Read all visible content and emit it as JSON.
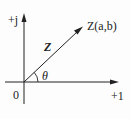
{
  "diagram": {
    "type": "complex-plane-vector",
    "axes": {
      "imaginary_label": "+j",
      "real_label": "+1",
      "origin_label": "0"
    },
    "vector": {
      "name": "Z",
      "point_label": "Z(a,b)",
      "angle_label": "θ"
    },
    "colors": {
      "line": "#222222",
      "background": "#fdfdfd"
    }
  }
}
